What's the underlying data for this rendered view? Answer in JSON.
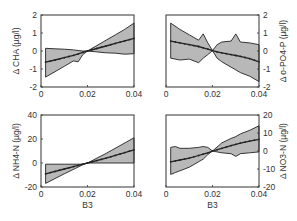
{
  "figure": {
    "background": "#ffffff",
    "band_color": "#b8b8b8",
    "line_color": "#222222"
  },
  "chart_data": [
    {
      "type": "area",
      "panel": "top-left",
      "title": "",
      "xlabel": "",
      "ylabel": "Δ CHA (µg/l)",
      "ylabel_side": "left",
      "xlim": [
        0,
        0.04
      ],
      "ylim": [
        -2,
        2
      ],
      "xticks": [
        "0",
        "0.02",
        "0.04"
      ],
      "yticks": [
        "-2",
        "-1",
        "0",
        "1",
        "2"
      ],
      "ytick_values": [
        -2,
        -1,
        0,
        1,
        2
      ],
      "x": [
        0.002,
        0.006,
        0.01,
        0.014,
        0.016,
        0.018,
        0.02,
        0.024,
        0.028,
        0.032,
        0.036,
        0.04
      ],
      "series": [
        {
          "name": "mean",
          "values": [
            -0.62,
            -0.5,
            -0.37,
            -0.24,
            -0.16,
            -0.08,
            0.0,
            0.14,
            0.28,
            0.42,
            0.56,
            0.7
          ]
        },
        {
          "name": "upper",
          "values": [
            0.15,
            0.12,
            0.1,
            0.06,
            0.03,
            0.0,
            0.0,
            0.3,
            0.6,
            0.9,
            1.2,
            1.55
          ]
        },
        {
          "name": "lower",
          "values": [
            -1.45,
            -1.15,
            -0.85,
            -0.55,
            -0.6,
            -0.2,
            0.0,
            -0.05,
            -0.1,
            -0.12,
            -0.18,
            -0.15
          ]
        }
      ]
    },
    {
      "type": "area",
      "panel": "top-right",
      "title": "",
      "xlabel": "",
      "ylabel": "Δ o-PO4-P (µg/l)",
      "ylabel_side": "right",
      "xlim": [
        0,
        0.04
      ],
      "ylim": [
        -2,
        2
      ],
      "xticks": [
        "0",
        "0.02",
        "0.04"
      ],
      "yticks": [
        "-2",
        "-1",
        "0",
        "1",
        "2"
      ],
      "ytick_values": [
        -2,
        -1,
        0,
        1,
        2
      ],
      "x": [
        0.002,
        0.006,
        0.01,
        0.014,
        0.016,
        0.018,
        0.02,
        0.022,
        0.024,
        0.028,
        0.03,
        0.032,
        0.036,
        0.04
      ],
      "series": [
        {
          "name": "mean",
          "values": [
            0.55,
            0.45,
            0.35,
            0.25,
            0.18,
            0.1,
            0.02,
            -0.05,
            -0.1,
            -0.2,
            -0.25,
            -0.3,
            -0.42,
            -0.6
          ]
        },
        {
          "name": "upper",
          "values": [
            1.55,
            1.2,
            0.9,
            0.6,
            0.95,
            0.45,
            0.02,
            0.35,
            0.5,
            0.55,
            0.95,
            0.5,
            0.45,
            0.35
          ]
        },
        {
          "name": "lower",
          "values": [
            -0.4,
            -0.5,
            -0.45,
            -0.65,
            -0.4,
            -0.2,
            0.02,
            -0.4,
            -0.6,
            -0.9,
            -1.05,
            -1.2,
            -1.4,
            -1.7
          ]
        }
      ]
    },
    {
      "type": "area",
      "panel": "bottom-left",
      "title": "",
      "xlabel": "B3",
      "ylabel": "Δ NH4-N (µg/l)",
      "ylabel_side": "left",
      "xlim": [
        0,
        0.04
      ],
      "ylim": [
        -20,
        40
      ],
      "xticks": [
        "0",
        "0.02",
        "0.04"
      ],
      "yticks": [
        "-20",
        "0",
        "20",
        "40"
      ],
      "ytick_values": [
        -20,
        0,
        20,
        40
      ],
      "x": [
        0.002,
        0.01,
        0.018,
        0.02,
        0.028,
        0.04
      ],
      "series": [
        {
          "name": "mean",
          "values": [
            -9,
            -5,
            -1,
            0,
            4,
            11
          ]
        },
        {
          "name": "upper",
          "values": [
            -1,
            -1,
            -1,
            0,
            8,
            21
          ]
        },
        {
          "name": "lower",
          "values": [
            -17,
            -9,
            -1.5,
            0,
            0,
            0
          ]
        }
      ]
    },
    {
      "type": "area",
      "panel": "bottom-right",
      "title": "",
      "xlabel": "B3",
      "ylabel": "Δ NO3-N (µg/l)",
      "ylabel_side": "right",
      "xlim": [
        0,
        0.04
      ],
      "ylim": [
        -20,
        20
      ],
      "xticks": [
        "0",
        "0.02",
        "0.04"
      ],
      "yticks": [
        "-20",
        "-10",
        "0",
        "10",
        "20"
      ],
      "ytick_values": [
        -20,
        -10,
        0,
        10,
        20
      ],
      "x": [
        0.002,
        0.004,
        0.006,
        0.01,
        0.014,
        0.016,
        0.018,
        0.02,
        0.024,
        0.028,
        0.03,
        0.032,
        0.036,
        0.04
      ],
      "series": [
        {
          "name": "mean",
          "values": [
            -6,
            -5.5,
            -5,
            -4,
            -2.5,
            -1.8,
            -1,
            0,
            1.5,
            3,
            3.7,
            4.4,
            5.5,
            6.5
          ]
        },
        {
          "name": "upper",
          "values": [
            2,
            2.5,
            1.5,
            1.5,
            2,
            2.5,
            2,
            0,
            4.5,
            7,
            8,
            9.5,
            11.5,
            14
          ]
        },
        {
          "name": "lower",
          "values": [
            -13,
            -12,
            -11,
            -9,
            -6,
            -4.5,
            -2,
            0,
            -1,
            -1.5,
            -3,
            -1.5,
            -1,
            -0.5
          ]
        }
      ]
    }
  ]
}
